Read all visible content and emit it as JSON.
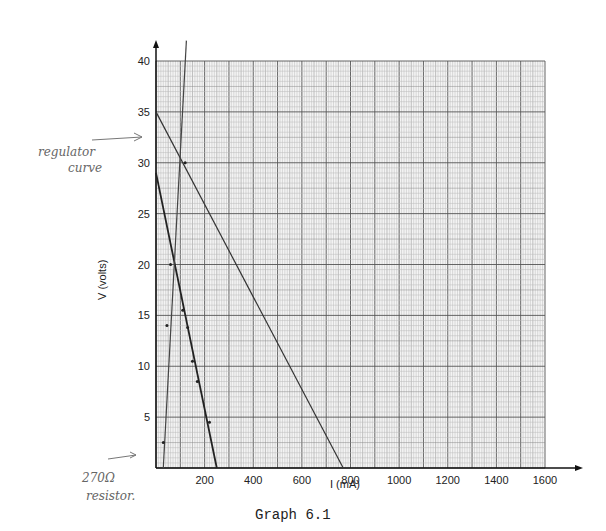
{
  "chart_data": {
    "type": "line",
    "title": "Graph 6.1",
    "xlabel": "I_L (mA)",
    "ylabel": "V_L (volts)",
    "xlim": [
      0,
      1600
    ],
    "ylim": [
      0,
      40
    ],
    "x_ticks": [
      200,
      400,
      600,
      800,
      1000,
      1200,
      1400,
      1600
    ],
    "y_ticks": [
      5,
      10,
      15,
      20,
      25,
      30,
      35,
      40
    ],
    "grid": true,
    "series": [
      {
        "name": "regulator curve",
        "x": [
          0,
          770
        ],
        "y": [
          35,
          0
        ]
      },
      {
        "name": "270Ω resistor",
        "x": [
          0,
          250
        ],
        "y": [
          29,
          0
        ],
        "points": [
          [
            60,
            20
          ],
          [
            110,
            15.5
          ],
          [
            130,
            13.8
          ],
          [
            150,
            10.5
          ],
          [
            170,
            8.5
          ],
          [
            220,
            4.5
          ]
        ]
      },
      {
        "name": "load line",
        "x": [
          30,
          125
        ],
        "y": [
          0,
          42
        ],
        "points": [
          [
            30,
            2.5
          ],
          [
            45,
            14
          ],
          [
            120,
            30
          ]
        ]
      }
    ],
    "annotations": [
      {
        "text": "regulator curve",
        "target": [
          0,
          35
        ]
      },
      {
        "text": "270Ω resistor",
        "target": [
          0,
          0
        ]
      }
    ]
  },
  "labels": {
    "caption": "Graph 6.1",
    "xlabel": "I  (mA)",
    "ylabel": "V  (volts)",
    "note_regulator_1": "regulator",
    "note_regulator_2": "curve",
    "note_resistor_1": "270Ω",
    "note_resistor_2": "resistor."
  }
}
